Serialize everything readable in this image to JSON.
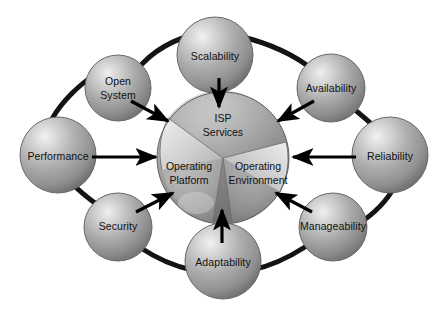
{
  "diagram": {
    "background_color": "#ffffff",
    "ring_color": "#111111",
    "arrow_color": "#000000",
    "sphere_base_color": "#9a9a9a",
    "sphere_highlight_color": "#e6e6e6",
    "center": {
      "name": "central-sphere",
      "cx": 223,
      "cy": 158,
      "r": 66,
      "sectors": [
        {
          "id": "isp-services",
          "label_line1": "ISP",
          "label_line2": "Services",
          "label_x": 223,
          "label_y": 125
        },
        {
          "id": "operating-platform",
          "label_line1": "Operating",
          "label_line2": "Platform",
          "label_x": 189,
          "label_y": 173
        },
        {
          "id": "operating-environment",
          "label_line1": "Operating",
          "label_line2": "Environment",
          "label_x": 257,
          "label_y": 173
        }
      ]
    },
    "nodes": [
      {
        "id": "scalability",
        "label": "Scalability",
        "cx": 215,
        "cy": 55,
        "r": 38,
        "label_x": 215,
        "label_y": 57
      },
      {
        "id": "open-system",
        "label_line1": "Open",
        "label_line2": "System",
        "cx": 118,
        "cy": 88,
        "r": 33,
        "label_x": 118,
        "label_y": 82
      },
      {
        "id": "performance",
        "label": "Performance",
        "cx": 58,
        "cy": 155,
        "r": 38,
        "label_x": 58,
        "label_y": 157
      },
      {
        "id": "security",
        "label": "Security",
        "cx": 118,
        "cy": 227,
        "r": 34,
        "label_x": 118,
        "label_y": 226
      },
      {
        "id": "adaptability",
        "label": "Adaptability",
        "cx": 223,
        "cy": 261,
        "r": 38,
        "label_x": 223,
        "label_y": 263
      },
      {
        "id": "manageability",
        "label": "Manageability",
        "cx": 333,
        "cy": 227,
        "r": 34,
        "label_x": 333,
        "label_y": 226
      },
      {
        "id": "reliability",
        "label": "Reliability",
        "cx": 390,
        "cy": 155,
        "r": 38,
        "label_x": 390,
        "label_y": 157
      },
      {
        "id": "availability",
        "label": "Availability",
        "cx": 331,
        "cy": 88,
        "r": 34,
        "label_x": 331,
        "label_y": 89
      }
    ],
    "arrows": [
      {
        "id": "arrow-scalability-to-center",
        "from": "scalability",
        "x1": 219,
        "y1": 78,
        "x2": 219,
        "y2": 108
      },
      {
        "id": "arrow-open-system-to-center",
        "from": "open-system",
        "x1": 131,
        "y1": 101,
        "x2": 169,
        "y2": 122
      },
      {
        "id": "arrow-performance-to-center",
        "from": "performance",
        "x1": 92,
        "y1": 157,
        "x2": 155,
        "y2": 157
      },
      {
        "id": "arrow-security-to-center",
        "from": "security",
        "x1": 136,
        "y1": 211,
        "x2": 172,
        "y2": 193
      },
      {
        "id": "arrow-adaptability-to-center",
        "from": "adaptability",
        "x1": 222,
        "y1": 242,
        "x2": 222,
        "y2": 209
      },
      {
        "id": "arrow-manageability-to-center",
        "from": "manageability",
        "x1": 312,
        "y1": 211,
        "x2": 275,
        "y2": 192
      },
      {
        "id": "arrow-reliability-to-center",
        "from": "reliability",
        "x1": 356,
        "y1": 157,
        "x2": 292,
        "y2": 157
      },
      {
        "id": "arrow-availability-to-center",
        "from": "availability",
        "x1": 314,
        "y1": 101,
        "x2": 277,
        "y2": 122
      }
    ],
    "ring_segments": [
      {
        "id": "ring-open-system-to-scalability",
        "path": "M 142,64 C 160,45 186,34 210,32"
      },
      {
        "id": "ring-scalability-to-availability",
        "path": "M 239,36 C 272,44 296,56 313,70"
      },
      {
        "id": "ring-availability-to-reliability",
        "path": "M 352,108 C 365,118 374,126 383,134"
      },
      {
        "id": "ring-reliability-to-manageability",
        "path": "M 392,191 C 382,207 366,220 350,229"
      },
      {
        "id": "ring-manageability-to-adaptability",
        "path": "M 305,247 C 288,258 270,266 252,270"
      },
      {
        "id": "ring-adaptability-to-security",
        "path": "M 192,270 C 174,266 156,258 141,248"
      },
      {
        "id": "ring-security-to-performance",
        "path": "M 98,205 C 84,196 74,186 64,176"
      },
      {
        "id": "ring-performance-to-open-system",
        "path": "M 52,119 C 62,101 80,84 96,74"
      }
    ]
  }
}
